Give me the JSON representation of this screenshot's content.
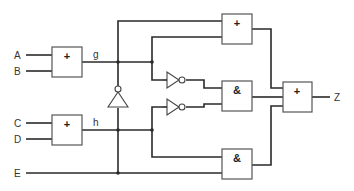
{
  "diagram": {
    "type": "logic-circuit",
    "inputs": [
      {
        "id": "A",
        "label": "A"
      },
      {
        "id": "B",
        "label": "B"
      },
      {
        "id": "C",
        "label": "C"
      },
      {
        "id": "D",
        "label": "D"
      },
      {
        "id": "E",
        "label": "E"
      }
    ],
    "output": {
      "id": "Z",
      "label": "Z"
    },
    "internal_signals": [
      {
        "id": "g",
        "label": "g"
      },
      {
        "id": "h",
        "label": "h"
      }
    ],
    "gates": [
      {
        "id": "or_ab",
        "symbol": "+",
        "kind": "OR",
        "inputs": [
          "A",
          "B"
        ],
        "output": "g"
      },
      {
        "id": "or_cd",
        "symbol": "+",
        "kind": "OR",
        "inputs": [
          "C",
          "D"
        ],
        "output": "h"
      },
      {
        "id": "not_e",
        "symbol": "",
        "kind": "NOT",
        "inputs": [
          "E"
        ],
        "output": "not_E"
      },
      {
        "id": "not_g",
        "symbol": "",
        "kind": "NOT",
        "inputs": [
          "g"
        ],
        "output": "not_g"
      },
      {
        "id": "not_h",
        "symbol": "",
        "kind": "NOT",
        "inputs": [
          "h"
        ],
        "output": "not_h"
      },
      {
        "id": "or_top",
        "symbol": "+",
        "kind": "OR",
        "inputs": [
          "not_E",
          "g"
        ],
        "output": "t1"
      },
      {
        "id": "and_mid",
        "symbol": "&",
        "kind": "AND",
        "inputs": [
          "not_g",
          "not_h"
        ],
        "output": "t2"
      },
      {
        "id": "and_bot",
        "symbol": "&",
        "kind": "AND",
        "inputs": [
          "h",
          "E"
        ],
        "output": "t3"
      },
      {
        "id": "or_out",
        "symbol": "+",
        "kind": "OR",
        "inputs": [
          "t1",
          "t2",
          "t3"
        ],
        "output": "Z"
      }
    ]
  }
}
